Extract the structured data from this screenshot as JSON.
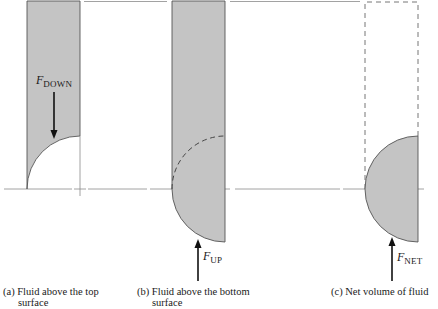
{
  "figure": {
    "colors": {
      "fluid_fill": "#c4c4c4",
      "outline": "#555555",
      "axis_line": "#8a8a8a",
      "arrow": "#111111",
      "dashed": "#666666"
    },
    "panels": [
      {
        "id": "a",
        "force_label": {
          "symbol": "F",
          "subscript": "DOWN"
        },
        "caption": {
          "line1": "(a) Fluid above the top",
          "line2": "surface"
        }
      },
      {
        "id": "b",
        "force_label": {
          "symbol": "F",
          "subscript": "UP"
        },
        "caption": {
          "line1": "(b) Fluid above the bottom",
          "line2": "surface"
        }
      },
      {
        "id": "c",
        "force_label": {
          "symbol": "F",
          "subscript": "NET"
        },
        "caption": {
          "line1": "(c) Net volume of fluid",
          "line2": ""
        }
      }
    ]
  }
}
